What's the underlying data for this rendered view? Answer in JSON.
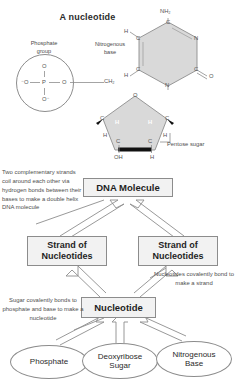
{
  "title": "A nucleotide",
  "molecule": {
    "phosphate_label": "Phosphate\ngroup",
    "phosphate_label_line1": "Phosphate",
    "phosphate_label_line2": "group",
    "nitrogenous_label_line1": "Nitrogenous",
    "nitrogenous_label_line2": "base",
    "pentose_label": "Pentose sugar",
    "atoms": {
      "p_center": "P",
      "o_top": "O",
      "o_left": "⁻O",
      "o_right": "O",
      "o_bottom": "O⁻",
      "ch2": "CH₂",
      "ring_o": "O",
      "c_left": "C",
      "c_right": "C",
      "h_left_in": "H",
      "h_right_in": "H",
      "h_left_out": "H",
      "h_right_out": "H",
      "c_bot_left": "C",
      "c_bot_right": "C",
      "oh": "OH",
      "h_bottom": "H",
      "nh2": "NH₂",
      "base_c_top": "C",
      "base_n_right": "N",
      "base_c_rb": "C",
      "base_o": "O",
      "base_n_bottom": "N",
      "base_c_lb": "C",
      "base_c_lt": "C",
      "base_h_lt": "H",
      "base_h_lb": "H"
    }
  },
  "flow": {
    "dna_molecule": "DNA Molecule",
    "strand_left_line1": "Strand of",
    "strand_left_line2": "Nucleotides",
    "strand_right_line1": "Strand of",
    "strand_right_line2": "Nucleotides",
    "nucleotide": "Nucleotide",
    "phosphate": "Phosphate",
    "sugar_line1": "Deoxyribose",
    "sugar_line2": "Sugar",
    "base_line1": "Nitrogenous",
    "base_line2": "Base"
  },
  "notes": {
    "left": "Two complementary strands coil around each other via hydrogen bonds between their bases to make a double helix DNA molecule",
    "right": "Nucleotides covalently bond to make a strand",
    "bottom": "Sugar covalently bonds to phosphate and base to make a nucleotide"
  },
  "colors": {
    "ring_fill": "#d9d9d9",
    "box_fill": "#f2f2f2",
    "stroke": "#8c8c8c",
    "text": "#2a2a2a"
  }
}
